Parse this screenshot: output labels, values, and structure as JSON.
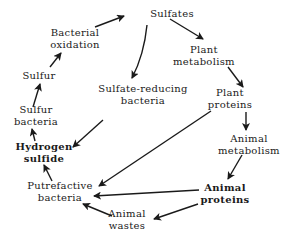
{
  "diagram": {
    "nodes": [
      {
        "id": "sulfates",
        "lines": [
          "Sulfates"
        ],
        "x": 172,
        "y": 14
      },
      {
        "id": "bacterial-oxidation",
        "lines": [
          "Bacterial",
          "oxidation"
        ],
        "x": 75,
        "y": 39
      },
      {
        "id": "plant-metabolism",
        "lines": [
          "Plant",
          "metabolism"
        ],
        "x": 204,
        "y": 56
      },
      {
        "id": "sulfur",
        "lines": [
          "Sulfur"
        ],
        "x": 39,
        "y": 76
      },
      {
        "id": "sulfate-reducing-bacteria",
        "lines": [
          "Sulfate-reducing",
          "bacteria"
        ],
        "x": 143,
        "y": 95
      },
      {
        "id": "plant-proteins",
        "lines": [
          "Plant",
          "proteins"
        ],
        "x": 230,
        "y": 99
      },
      {
        "id": "sulfur-bacteria",
        "lines": [
          "Sulfur",
          "bacteria"
        ],
        "x": 36,
        "y": 116
      },
      {
        "id": "hydrogen-sulfide",
        "lines": [
          "Hydrogen",
          "sulfide"
        ],
        "x": 44,
        "y": 153
      },
      {
        "id": "animal-metabolism",
        "lines": [
          "Animal",
          "metabolism"
        ],
        "x": 249,
        "y": 145
      },
      {
        "id": "putrefactive-bacteria",
        "lines": [
          "Putrefactive",
          "bacteria"
        ],
        "x": 60,
        "y": 192
      },
      {
        "id": "animal-proteins",
        "lines": [
          "Animal",
          "proteins"
        ],
        "x": 225,
        "y": 194
      },
      {
        "id": "animal-wastes",
        "lines": [
          "Animal",
          "wastes"
        ],
        "x": 127,
        "y": 220
      }
    ],
    "edges": [
      {
        "from": "bacterial-oxidation",
        "to": "sulfates"
      },
      {
        "from": "sulfates",
        "to": "plant-metabolism"
      },
      {
        "from": "sulfates",
        "to": "sulfate-reducing-bacteria"
      },
      {
        "from": "plant-metabolism",
        "to": "plant-proteins"
      },
      {
        "from": "plant-proteins",
        "to": "animal-metabolism"
      },
      {
        "from": "plant-proteins",
        "to": "putrefactive-bacteria"
      },
      {
        "from": "animal-metabolism",
        "to": "animal-proteins"
      },
      {
        "from": "animal-proteins",
        "to": "putrefactive-bacteria"
      },
      {
        "from": "animal-proteins",
        "to": "animal-wastes"
      },
      {
        "from": "animal-wastes",
        "to": "putrefactive-bacteria"
      },
      {
        "from": "putrefactive-bacteria",
        "to": "hydrogen-sulfide"
      },
      {
        "from": "sulfate-reducing-bacteria",
        "to": "hydrogen-sulfide"
      },
      {
        "from": "hydrogen-sulfide",
        "to": "sulfur-bacteria"
      },
      {
        "from": "sulfur-bacteria",
        "to": "sulfur"
      },
      {
        "from": "sulfur",
        "to": "bacterial-oxidation"
      }
    ],
    "colors": {
      "ink": "#1a1a1a",
      "background": "#ffffff"
    }
  }
}
